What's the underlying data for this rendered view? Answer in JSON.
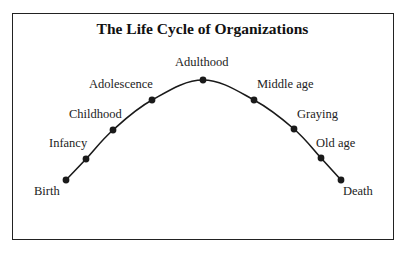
{
  "diagram": {
    "title": "The Life Cycle of Organizations",
    "stages": [
      {
        "label": "Birth",
        "x": 66,
        "y": 180,
        "lx": 34,
        "ly": 184
      },
      {
        "label": "Infancy",
        "x": 86,
        "y": 159,
        "lx": 49,
        "ly": 136
      },
      {
        "label": "Childhood",
        "x": 113,
        "y": 130,
        "lx": 69,
        "ly": 107
      },
      {
        "label": "Adolescence",
        "x": 152,
        "y": 100,
        "lx": 89,
        "ly": 77
      },
      {
        "label": "Adulthood",
        "x": 203,
        "y": 80,
        "lx": 175,
        "ly": 55
      },
      {
        "label": "Middle age",
        "x": 254,
        "y": 100,
        "lx": 257,
        "ly": 77
      },
      {
        "label": "Graying",
        "x": 294,
        "y": 129,
        "lx": 297,
        "ly": 107
      },
      {
        "label": "Old age",
        "x": 321,
        "y": 158,
        "lx": 316,
        "ly": 136
      },
      {
        "label": "Death",
        "x": 341,
        "y": 180,
        "lx": 343,
        "ly": 184
      }
    ],
    "colors": {
      "line": "#1a1a1a",
      "frame": "#222222",
      "text": "#222222"
    }
  }
}
